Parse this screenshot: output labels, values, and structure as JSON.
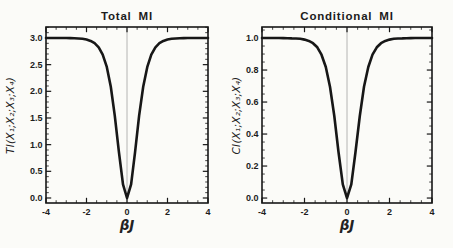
{
  "figure": {
    "background": "#fbfbf8",
    "ink": "#171717",
    "grid_color": "#ababab",
    "tick_label_color": "#1d1d1d"
  },
  "chart_data": [
    {
      "type": "line",
      "title": "Total MI",
      "xlabel": "βJ",
      "ylabel": "TI(X₁;X₂;X₃;X₄)",
      "xlim": [
        -4,
        4
      ],
      "ylim": [
        -0.094,
        3.206
      ],
      "grid": "vertical line at x=0 only",
      "legend_position": "none",
      "xticks": {
        "values": [
          -4,
          -2,
          0,
          2,
          4
        ],
        "labels": [
          "-4",
          "-2",
          "0",
          "2",
          "4"
        ]
      },
      "yticks": {
        "values": [
          0,
          0.5,
          1,
          1.5,
          2,
          2.5,
          3
        ],
        "labels": [
          "0.0",
          "0.5",
          "1.0",
          "1.5",
          "2.0",
          "2.5",
          "3.0"
        ]
      },
      "x_minor_step": 0.5,
      "y_minor_step": 0.1,
      "gridlines_x": [
        0
      ],
      "x": [
        -4,
        -3.8,
        -3.6,
        -3.4,
        -3.2,
        -3,
        -2.8,
        -2.6,
        -2.4,
        -2.2,
        -2,
        -1.8,
        -1.6,
        -1.4,
        -1.2,
        -1,
        -0.8,
        -0.6,
        -0.4,
        -0.2,
        0,
        0.2,
        0.4,
        0.6,
        0.8,
        1,
        1.2,
        1.4,
        1.6,
        1.8,
        2,
        2.2,
        2.4,
        2.6,
        2.8,
        3,
        3.2,
        3.4,
        3.6,
        3.8,
        4
      ],
      "y": [
        3.0,
        3.0,
        3.0,
        3.0,
        2.999,
        2.999,
        2.997,
        2.995,
        2.991,
        2.984,
        2.971,
        2.946,
        2.903,
        2.826,
        2.689,
        2.458,
        2.085,
        1.539,
        0.865,
        0.255,
        0.0,
        0.255,
        0.865,
        1.539,
        2.085,
        2.458,
        2.689,
        2.826,
        2.903,
        2.946,
        2.971,
        2.984,
        2.991,
        2.995,
        2.997,
        2.999,
        2.999,
        3.0,
        3.0,
        3.0,
        3.0
      ]
    },
    {
      "type": "line",
      "title": "Conditional MI",
      "xlabel": "βJ",
      "ylabel": "CI(X₁;X₂;X₃;X₄)",
      "xlim": [
        -4,
        4
      ],
      "ylim": [
        -0.031,
        1.069
      ],
      "grid": "vertical line at x=0 only",
      "legend_position": "none",
      "xticks": {
        "values": [
          -4,
          -2,
          0,
          2,
          4
        ],
        "labels": [
          "-4",
          "-2",
          "0",
          "2",
          "4"
        ]
      },
      "yticks": {
        "values": [
          0,
          0.2,
          0.4,
          0.6,
          0.8,
          1.0
        ],
        "labels": [
          "0.0",
          "0.2",
          "0.4",
          "0.6",
          "0.8",
          "1.0"
        ]
      },
      "x_minor_step": 0.5,
      "y_minor_step": 0.05,
      "gridlines_x": [
        0
      ],
      "x": [
        -4,
        -3.8,
        -3.6,
        -3.4,
        -3.2,
        -3,
        -2.8,
        -2.6,
        -2.4,
        -2.2,
        -2,
        -1.8,
        -1.6,
        -1.4,
        -1.2,
        -1,
        -0.8,
        -0.6,
        -0.4,
        -0.2,
        0,
        0.2,
        0.4,
        0.6,
        0.8,
        1,
        1.2,
        1.4,
        1.6,
        1.8,
        2,
        2.2,
        2.4,
        2.6,
        2.8,
        3,
        3.2,
        3.4,
        3.6,
        3.8,
        4
      ],
      "y": [
        1.0,
        1.0,
        1.0,
        1.0,
        1.0,
        0.9995,
        0.999,
        0.998,
        0.997,
        0.995,
        0.99,
        0.982,
        0.968,
        0.942,
        0.896,
        0.819,
        0.695,
        0.513,
        0.288,
        0.085,
        0.0,
        0.085,
        0.288,
        0.513,
        0.695,
        0.819,
        0.896,
        0.942,
        0.968,
        0.982,
        0.99,
        0.995,
        0.997,
        0.998,
        0.999,
        0.9995,
        1.0,
        1.0,
        1.0,
        1.0,
        1.0
      ]
    }
  ]
}
